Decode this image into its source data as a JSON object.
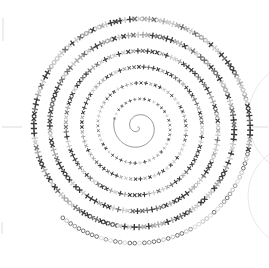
{
  "figure": {
    "title": "",
    "background_color": "#ffffff",
    "width": 269,
    "height": 268,
    "has_axes_frame": false,
    "has_grid": false,
    "has_legend": false,
    "has_tick_labels": false
  },
  "chart_data": {
    "type": "scatter",
    "title": "",
    "subtitle": "",
    "xlabel": "",
    "ylabel": "",
    "coordinate_system": "polar",
    "spiral_equation": "r = a + b * theta",
    "a": 0,
    "b": 2.55,
    "theta_start_deg": 0,
    "theta_end_deg": 2880,
    "turns": 8,
    "center_px": [
      138,
      127
    ],
    "r_min_px": 4,
    "r_max_px": 118,
    "marker_theta_start_deg": 560,
    "marker_count": 640,
    "markers": {
      "primary_glyph": "x",
      "secondary_glyph": "+",
      "outer_ring_glyph": "o",
      "size_min_px": 2.2,
      "size_max_px": 6.2,
      "rotation_follows_tangent": true
    },
    "grid": false,
    "legend_position": "none",
    "xlim": [
      -130,
      130
    ],
    "ylim": [
      -130,
      130
    ],
    "colors": {
      "marker_dark": "#3a3a3a",
      "marker_mid": "#6e6e6e",
      "marker_light": "#a8a8a8",
      "marker_faint": "#c8c8c8",
      "core_curve": "#5a5a5a",
      "axis_hairline": "#cfcfcf",
      "edge_arc": "#e2e2e2",
      "background": "#ffffff"
    }
  },
  "annotations": {
    "left_axis_stub_label": "",
    "right_axis_stub_label": "",
    "left_tick_mark_label": "",
    "corner_mark_label": ""
  },
  "overlays": [
    {
      "name": "left-axis-stub",
      "kind": "hairline-horizontal",
      "x1": 2,
      "y1": 127,
      "x2": 22,
      "y2": 127
    },
    {
      "name": "right-axis-stub",
      "kind": "hairline-horizontal",
      "x1": 252,
      "y1": 127,
      "x2": 268,
      "y2": 127
    },
    {
      "name": "left-edge-tick",
      "kind": "hairline-vertical",
      "x1": 3,
      "y1": 18,
      "x2": 3,
      "y2": 41
    },
    {
      "name": "bottom-left-tick",
      "kind": "hairline-vertical",
      "x1": 2,
      "y1": 222,
      "x2": 2,
      "y2": 234
    },
    {
      "name": "right-clip-arc-upper",
      "kind": "arc",
      "cx": 306,
      "cy": 118,
      "r": 58,
      "start_deg": 118,
      "end_deg": 242
    },
    {
      "name": "right-clip-arc-lower",
      "kind": "arc",
      "cx": 300,
      "cy": 196,
      "r": 52,
      "start_deg": 120,
      "end_deg": 240
    }
  ]
}
